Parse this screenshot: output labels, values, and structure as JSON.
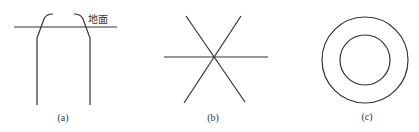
{
  "figure": {
    "panels": [
      {
        "id": "a",
        "caption": "(a)",
        "ground_label": "地面",
        "description": "Two vertical lines bending outward-inward near the top, crossing a horizontal ground line"
      },
      {
        "id": "b",
        "caption": "(b)",
        "description": "Three lines intersecting at a common center forming a six-pointed star"
      },
      {
        "id": "c",
        "caption": "(c)",
        "description": "Two concentric circles"
      }
    ],
    "stroke_color": "#333333",
    "background": "#ffffff"
  }
}
